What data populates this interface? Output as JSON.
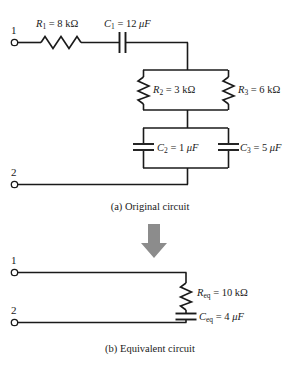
{
  "figure": {
    "wire_color": "#1a1a1a",
    "arrow_color": "#8c8c8c",
    "background": "#ffffff"
  },
  "original_circuit": {
    "caption": "(a) Original circuit",
    "terminals": [
      {
        "name": "terminal-1",
        "label": "1"
      },
      {
        "name": "terminal-2",
        "label": "2"
      }
    ],
    "components": [
      {
        "id": "R1",
        "type": "resistor",
        "orientation": "horizontal",
        "symbol": "resistor-zigzag",
        "name_text": "R",
        "subscript": "1",
        "equals": "=",
        "value": "8",
        "unit": "kΩ",
        "label": "R1 = 8 kΩ"
      },
      {
        "id": "C1",
        "type": "capacitor",
        "orientation": "horizontal",
        "symbol": "capacitor-vertical-plates",
        "name_text": "C",
        "subscript": "1",
        "equals": "=",
        "value": "12",
        "unit": "μF",
        "label": "C1 = 12 μF"
      },
      {
        "id": "R2",
        "type": "resistor",
        "orientation": "vertical",
        "symbol": "resistor-zigzag",
        "name_text": "R",
        "subscript": "2",
        "equals": "=",
        "value": "3",
        "unit": "kΩ",
        "label": "R2 = 3 kΩ"
      },
      {
        "id": "R3",
        "type": "resistor",
        "orientation": "vertical",
        "symbol": "resistor-zigzag",
        "name_text": "R",
        "subscript": "3",
        "equals": "=",
        "value": "6",
        "unit": "kΩ",
        "label": "R3 = 6 kΩ"
      },
      {
        "id": "C2",
        "type": "capacitor",
        "orientation": "vertical",
        "symbol": "capacitor-horizontal-plates",
        "name_text": "C",
        "subscript": "2",
        "equals": "=",
        "value": "1",
        "unit": "μF",
        "label": "C2 = 1 μF"
      },
      {
        "id": "C3",
        "type": "capacitor",
        "orientation": "vertical",
        "symbol": "capacitor-horizontal-plates",
        "name_text": "C",
        "subscript": "3",
        "equals": "=",
        "value": "5",
        "unit": "μF",
        "label": "C3 = 5 μF"
      }
    ]
  },
  "transition": {
    "arrow": "down-arrow",
    "direction": "down"
  },
  "equivalent_circuit": {
    "caption": "(b) Equivalent circuit",
    "terminals": [
      {
        "name": "terminal-1",
        "label": "1"
      },
      {
        "name": "terminal-2",
        "label": "2"
      }
    ],
    "components": [
      {
        "id": "Req",
        "type": "resistor",
        "orientation": "vertical",
        "symbol": "resistor-zigzag",
        "name_text": "R",
        "subscript": "eq",
        "equals": "=",
        "value": "10",
        "unit": "kΩ",
        "label": "Req = 10 kΩ"
      },
      {
        "id": "Ceq",
        "type": "capacitor",
        "orientation": "vertical",
        "symbol": "capacitor-horizontal-plates",
        "name_text": "C",
        "subscript": "eq",
        "equals": "=",
        "value": "4",
        "unit": "μF",
        "label": "Ceq = 4 μF"
      }
    ]
  }
}
